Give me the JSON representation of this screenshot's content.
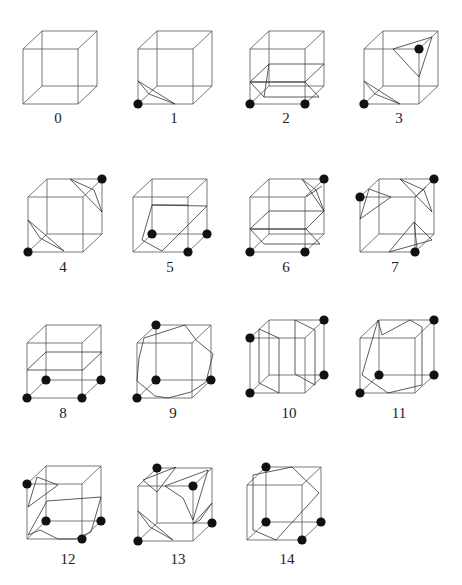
{
  "figure": {
    "colors": {
      "edge": "#555555",
      "surface": "#333333",
      "dot": "#111111",
      "label": "#222222",
      "background": "#ffffff"
    },
    "cube_geometry": {
      "size": 55,
      "depth_dx": 19,
      "depth_dy": -18,
      "dot_radius": 4.6
    }
  },
  "cases": [
    {
      "label": "0",
      "origin": [
        23,
        49
      ],
      "label_pos": [
        58,
        123
      ],
      "dots": [],
      "polygons": []
    },
    {
      "label": "1",
      "origin": [
        138,
        49
      ],
      "label_pos": [
        174,
        123
      ],
      "dots": [
        "FBL"
      ],
      "polygons": [
        [
          [
            138,
            81
          ],
          [
            175,
            104
          ],
          [
            149,
            94
          ]
        ]
      ]
    },
    {
      "label": "2",
      "origin": [
        250,
        49
      ],
      "label_pos": [
        286,
        123
      ],
      "dots": [
        "FBL",
        "FBR"
      ],
      "polygons": [
        [
          [
            250,
            82
          ],
          [
            305,
            82
          ],
          [
            324,
            64
          ],
          [
            269,
            64
          ]
        ],
        [
          [
            250,
            82
          ],
          [
            264,
            97
          ],
          [
            319,
            97
          ],
          [
            305,
            82
          ]
        ],
        [
          [
            264,
            97
          ],
          [
            269,
            64
          ]
        ]
      ]
    },
    {
      "label": "3",
      "origin": [
        364,
        49
      ],
      "label_pos": [
        399,
        123
      ],
      "dots": [
        "FBL",
        "FTR"
      ],
      "polygons": [
        [
          [
            364,
            81
          ],
          [
            400,
            104
          ],
          [
            375,
            94
          ]
        ],
        [
          [
            393,
            49
          ],
          [
            432,
            37
          ],
          [
            419,
            77
          ]
        ]
      ]
    },
    {
      "label": "4",
      "origin": [
        28,
        197
      ],
      "label_pos": [
        63,
        272
      ],
      "dots": [
        "FBL",
        "BTR"
      ],
      "polygons": [
        [
          [
            28,
            220
          ],
          [
            64,
            251
          ],
          [
            40,
            238
          ]
        ],
        [
          [
            70,
            179
          ],
          [
            102,
            212
          ],
          [
            94,
            190
          ]
        ]
      ]
    },
    {
      "label": "5",
      "origin": [
        133,
        197
      ],
      "label_pos": [
        170,
        272
      ],
      "dots": [
        "BBL",
        "BBR",
        "FBR"
      ],
      "polygons": [
        [
          [
            152,
            205
          ],
          [
            207,
            206
          ],
          [
            162,
            251
          ],
          [
            142,
            240
          ]
        ],
        [
          [
            152,
            205
          ],
          [
            188,
            205
          ]
        ]
      ]
    },
    {
      "label": "6",
      "origin": [
        250,
        197
      ],
      "label_pos": [
        286,
        272
      ],
      "dots": [
        "FBL",
        "FBR",
        "BTR"
      ],
      "polygons": [
        [
          [
            250,
            229
          ],
          [
            306,
            229
          ],
          [
            324,
            211
          ],
          [
            269,
            211
          ]
        ],
        [
          [
            250,
            229
          ],
          [
            264,
            244
          ],
          [
            320,
            244
          ],
          [
            306,
            229
          ]
        ],
        [
          [
            302,
            179
          ],
          [
            324,
            211
          ],
          [
            316,
            190
          ]
        ],
        [
          [
            306,
            197
          ],
          [
            322,
            186
          ]
        ]
      ]
    },
    {
      "label": "7",
      "origin": [
        360,
        197
      ],
      "label_pos": [
        395,
        272
      ],
      "dots": [
        "FTL",
        "BTR",
        "FBR"
      ],
      "polygons": [
        [
          [
            369,
            189
          ],
          [
            391,
            197
          ],
          [
            360,
            219
          ]
        ],
        [
          [
            400,
            179
          ],
          [
            432,
            212
          ],
          [
            424,
            190
          ]
        ],
        [
          [
            415,
            197
          ],
          [
            426,
            187
          ]
        ],
        [
          [
            389,
            252
          ],
          [
            414,
            222
          ],
          [
            432,
            240
          ]
        ],
        [
          [
            414,
            222
          ],
          [
            417,
            248
          ]
        ]
      ]
    },
    {
      "label": "8",
      "origin": [
        27,
        343
      ],
      "label_pos": [
        63,
        418
      ],
      "dots": [
        "FBL",
        "FBR",
        "BBL",
        "BBR"
      ],
      "polygons": [
        [
          [
            27,
            370
          ],
          [
            83,
            370
          ],
          [
            102,
            352
          ],
          [
            46,
            352
          ]
        ]
      ]
    },
    {
      "label": "9",
      "origin": [
        137,
        343
      ],
      "label_pos": [
        173,
        418
      ],
      "dots": [
        "FBL",
        "BBL",
        "BBR",
        "BTL"
      ],
      "polygons": [
        [
          [
            144,
            338
          ],
          [
            185,
            325
          ],
          [
            196,
            340
          ],
          [
            213,
            354
          ],
          [
            206,
            382
          ],
          [
            191,
            392
          ],
          [
            168,
            398
          ],
          [
            155,
            396
          ],
          [
            137,
            381
          ],
          [
            139,
            358
          ]
        ]
      ]
    },
    {
      "label": "10",
      "origin": [
        250,
        338
      ],
      "label_pos": [
        289,
        418
      ],
      "dots": [
        "FTL",
        "FBL",
        "BTR",
        "BBR"
      ],
      "polygons": [
        [
          [
            259,
            329
          ],
          [
            279,
            338
          ],
          [
            279,
            393
          ],
          [
            259,
            383
          ]
        ],
        [
          [
            295,
            320
          ],
          [
            315,
            330
          ],
          [
            315,
            385
          ],
          [
            295,
            374
          ]
        ]
      ]
    },
    {
      "label": "11",
      "origin": [
        360,
        338
      ],
      "label_pos": [
        399,
        418
      ],
      "dots": [
        "FBL",
        "BBL",
        "BBR",
        "BTR"
      ],
      "polygons": [
        [
          [
            378,
            320
          ],
          [
            362,
            375
          ],
          [
            388,
            393
          ],
          [
            422,
            385
          ],
          [
            422,
            327
          ],
          [
            410,
            320
          ],
          [
            382,
            335
          ],
          [
            378,
            320
          ]
        ]
      ]
    },
    {
      "label": "12",
      "origin": [
        27,
        484
      ],
      "label_pos": [
        68,
        564
      ],
      "dots": [
        "FTL",
        "BBL",
        "BBR",
        "FBR"
      ],
      "polygons": [
        [
          [
            37,
            477
          ],
          [
            58,
            485
          ],
          [
            28,
            507
          ]
        ],
        [
          [
            47,
            501
          ],
          [
            101,
            497
          ],
          [
            91,
            532
          ],
          [
            75,
            539
          ],
          [
            58,
            539
          ],
          [
            40,
            530
          ],
          [
            28,
            535
          ],
          [
            47,
            501
          ]
        ]
      ]
    },
    {
      "label": "13",
      "origin": [
        138,
        486
      ],
      "label_pos": [
        178,
        564
      ],
      "dots": [
        "BTL",
        "FTR",
        "BBR",
        "FBL"
      ],
      "polygons": [
        [
          [
            143,
            480
          ],
          [
            176,
            467
          ],
          [
            157,
            492
          ]
        ],
        [
          [
            165,
            486
          ],
          [
            208,
            470
          ],
          [
            193,
            520
          ],
          [
            183,
            498
          ]
        ],
        [
          [
            138,
            511
          ],
          [
            173,
            540
          ],
          [
            150,
            527
          ]
        ],
        [
          [
            193,
            524
          ],
          [
            212,
            503
          ],
          [
            200,
            520
          ]
        ]
      ]
    },
    {
      "label": "14",
      "origin": [
        247,
        485
      ],
      "label_pos": [
        287,
        564
      ],
      "dots": [
        "BTL",
        "BBL",
        "BBR",
        "FBR"
      ],
      "polygons": [
        [
          [
            253,
            475
          ],
          [
            292,
            467
          ],
          [
            319,
            493
          ],
          [
            276,
            540
          ],
          [
            253,
            530
          ],
          [
            253,
            475
          ]
        ]
      ]
    }
  ]
}
